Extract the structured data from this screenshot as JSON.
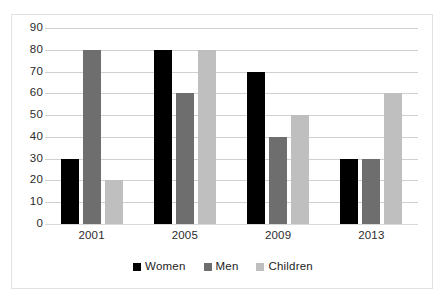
{
  "chart_data": {
    "type": "bar",
    "title": "",
    "subtitle": "",
    "xlabel": "",
    "ylabel": "",
    "categories": [
      "2001",
      "2005",
      "2009",
      "2013"
    ],
    "series": [
      {
        "name": "Women",
        "values": [
          30,
          80,
          70,
          30
        ],
        "color": "#000000"
      },
      {
        "name": "Men",
        "values": [
          80,
          60,
          40,
          30
        ],
        "color": "#6e6e6e"
      },
      {
        "name": "Children",
        "values": [
          20,
          80,
          50,
          60
        ],
        "color": "#bfbfbf"
      }
    ],
    "ylim": [
      0,
      90
    ],
    "y_ticks": [
      0,
      10,
      20,
      30,
      40,
      50,
      60,
      70,
      80,
      90
    ],
    "y_tick_labels": [
      "0",
      "10",
      "20",
      "30",
      "40",
      "50",
      "60",
      "70",
      "80",
      "90"
    ],
    "grid": true,
    "grid_axis": "y",
    "legend_position": "bottom",
    "legend_entries": [
      "Women",
      "Men",
      "Children"
    ],
    "annotations": [],
    "background_color": "#ffffff",
    "border_color": "#e2e2e2",
    "gridline_color": "#d0d0d0",
    "axis_text_color": "#2b2b2b"
  }
}
